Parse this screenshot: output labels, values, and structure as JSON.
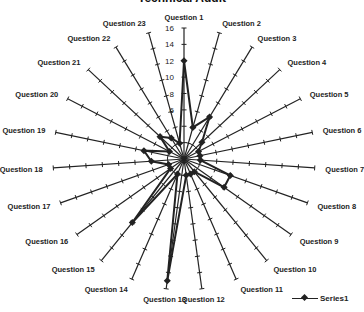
{
  "chart_data": {
    "type": "radar",
    "title": "Technical Audit",
    "categories": [
      "Question 1",
      "Question 2",
      "Question 3",
      "Question 4",
      "Question 5",
      "Question 6",
      "Question 7",
      "Question 8",
      "Question 9",
      "Question 10",
      "Question 11",
      "Question 12",
      "Question 13",
      "Question 14",
      "Question 15",
      "Question 16",
      "Question 17",
      "Question 18",
      "Question 19",
      "Question 20",
      "Question 21",
      "Question 22",
      "Question 23"
    ],
    "series": [
      {
        "name": "Series1",
        "values": [
          12,
          4,
          6,
          3,
          2,
          2,
          2,
          6,
          6,
          2,
          2,
          2,
          15,
          2,
          10,
          2,
          2,
          4,
          5,
          2,
          4,
          3,
          2
        ],
        "color": "#222222",
        "marker": "diamond"
      }
    ],
    "axis": {
      "min": 0,
      "max": 16,
      "step": 2,
      "tick_labels": [
        "2",
        "4",
        "6",
        "8",
        "10",
        "12",
        "14",
        "16"
      ]
    },
    "legend": {
      "position": "bottom-right",
      "entries": [
        "Series1"
      ]
    },
    "grid": false
  }
}
